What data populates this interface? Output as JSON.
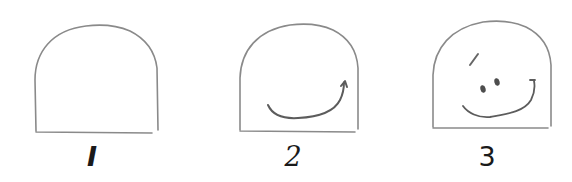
{
  "figure": {
    "stroke_color": "#7a7a7a",
    "feature_color": "#555555",
    "steps": [
      {
        "label": "I",
        "name": "outline",
        "elements": [
          "dome-outline"
        ]
      },
      {
        "label": "2",
        "name": "add-smile",
        "elements": [
          "dome-outline",
          "smile"
        ]
      },
      {
        "label": "3",
        "name": "add-eyes-and-brow",
        "elements": [
          "dome-outline",
          "smile",
          "eyebrow",
          "left-eye",
          "right-eye"
        ]
      }
    ]
  }
}
